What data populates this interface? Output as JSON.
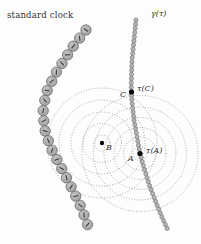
{
  "figure": {
    "colors": {
      "background": "#fdfdfd",
      "bead_fill": "#c2c2c2",
      "bead_fill_dark": "#9e9e9e",
      "bead_stroke": "#5e5e5e",
      "bead_tick": "#3d3d3d",
      "small_bead_fill": "#b5b5b5",
      "small_bead_stroke": "#5a5a5a",
      "wavefront": "#8f8f8f",
      "event_dot": "#0a0a0a",
      "label": "#333333"
    },
    "labels": {
      "standard_clock": {
        "text": "standard clock",
        "x": 7,
        "y": 11
      },
      "gamma_curve": {
        "text": "γ(τ)",
        "x": 151,
        "y": 10
      },
      "event_C": {
        "text": "C",
        "x": 120,
        "y": 91
      },
      "tau_C": {
        "text": "τ(C)",
        "x": 137,
        "y": 85
      },
      "event_B": {
        "text": "B",
        "x": 106,
        "y": 144
      },
      "event_A": {
        "text": "A",
        "x": 128,
        "y": 155
      },
      "tau_A": {
        "text": "τ(A)",
        "x": 146,
        "y": 147
      }
    },
    "event_dots": [
      {
        "name": "C",
        "x": 131.5,
        "y": 92,
        "r": 2.6
      },
      {
        "name": "B",
        "x": 102,
        "y": 143,
        "r": 2.2
      },
      {
        "name": "A",
        "x": 140,
        "y": 153.5,
        "r": 2.6
      }
    ],
    "wavefront_families": [
      {
        "name": "wavefronts-from-B",
        "cx": 102,
        "cy": 143,
        "radii": [
          8,
          19.5,
          31,
          43,
          55
        ]
      },
      {
        "name": "wavefronts-from-A",
        "cx": 140,
        "cy": 153.5,
        "radii": [
          7,
          16.5,
          26,
          36,
          46.5,
          58
        ]
      }
    ],
    "clock_chain": {
      "name": "standard-clock-worldline",
      "bead_radius": 5.2,
      "spacing": 10.3,
      "waypoints": [
        [
          86,
          30
        ],
        [
          73,
          46.5
        ],
        [
          55.8,
          73
        ],
        [
          46,
          93
        ],
        [
          42.8,
          113
        ],
        [
          45.5,
          133.5
        ],
        [
          53,
          152.5
        ],
        [
          63,
          171
        ],
        [
          72.5,
          189.5
        ],
        [
          81.5,
          208
        ],
        [
          88.6,
          227.5
        ]
      ]
    },
    "gamma_chain": {
      "name": "gamma-worldline",
      "bead_radius": 2.1,
      "spacing": 4.2,
      "waypoints": [
        [
          136,
          20
        ],
        [
          132,
          60
        ],
        [
          131.2,
          85
        ],
        [
          131.8,
          100
        ],
        [
          134,
          120
        ],
        [
          137,
          137
        ],
        [
          140,
          153.5
        ],
        [
          144,
          168
        ],
        [
          149,
          184
        ],
        [
          155,
          200
        ],
        [
          161,
          215
        ],
        [
          166,
          226
        ],
        [
          168.5,
          231.5
        ]
      ]
    }
  }
}
